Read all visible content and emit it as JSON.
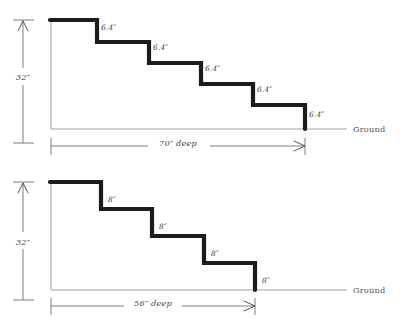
{
  "figure": {
    "background_color": "#ffffff",
    "ink_color": "#1c1c1c",
    "annotation_color": "#4a4a4a",
    "units": "inches"
  },
  "diagrams": [
    {
      "id": "upper-staircase",
      "total_height_label": "32″",
      "total_depth_label": "70″ deep",
      "ground_label": "Ground",
      "riser_count": 5,
      "riser_labels": [
        "6.4″",
        "6.4″",
        "6.4″",
        "6.4″",
        "6.4″"
      ],
      "riser_label_positions": [
        {
          "x": 101,
          "y": 30
        },
        {
          "x": 153,
          "y": 50
        },
        {
          "x": 205,
          "y": 71
        },
        {
          "x": 257,
          "y": 92
        },
        {
          "x": 309,
          "y": 117
        }
      ],
      "stair_outline": "M 50 20 L 97 20 L 97 42 L 149 42 L 149 63 L 201 63 L 201 84 L 253 84 L 253 105 L 305 105 L 305 129",
      "left_wall": "M 51 20 L 51 129",
      "ground_y": 129,
      "ground_x_start": 51,
      "ground_x_end": 347
    },
    {
      "id": "lower-staircase",
      "total_height_label": "32″",
      "total_depth_label": "56″ deep",
      "ground_label": "Ground",
      "riser_count": 4,
      "riser_labels": [
        "8″",
        "8″",
        "8″",
        "8″"
      ],
      "riser_label_positions": [
        {
          "x": 108,
          "y": 202
        },
        {
          "x": 159,
          "y": 229
        },
        {
          "x": 211,
          "y": 256
        },
        {
          "x": 262,
          "y": 283
        }
      ],
      "stair_outline": "M 50 182 L 101 182 L 101 209 L 152 209 L 152 236 L 204 236 L 204 263 L 255 263 L 255 290",
      "left_wall": "M 51 182 L 51 290",
      "ground_y": 290,
      "ground_x_start": 51,
      "ground_x_end": 347
    }
  ],
  "dimensions": {
    "vertical_upper": {
      "label": "32″",
      "x": 23,
      "top_y": 20,
      "bottom_y": 143,
      "label_x": 23,
      "label_y": 78
    },
    "vertical_lower": {
      "label": "32″",
      "x": 23,
      "top_y": 182,
      "bottom_y": 300,
      "label_x": 23,
      "label_y": 244
    },
    "horizontal_upper": {
      "label": "70″ deep",
      "y": 146,
      "left_x": 51,
      "right_x": 305,
      "label_x": 178,
      "label_y": 143
    },
    "horizontal_lower": {
      "label": "56″ deep",
      "y": 306,
      "left_x": 51,
      "right_x": 255,
      "label_x": 153,
      "label_y": 303
    }
  },
  "ground_labels": [
    {
      "text": "Ground",
      "x": 353,
      "y": 132
    },
    {
      "text": "Ground",
      "x": 353,
      "y": 293
    }
  ]
}
